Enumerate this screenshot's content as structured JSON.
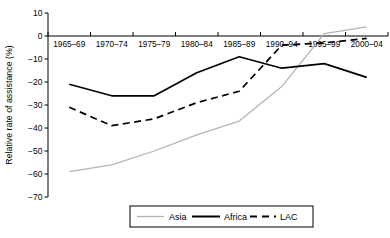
{
  "chart_data": {
    "type": "line",
    "title": "",
    "xlabel": "",
    "ylabel": "Relative rate of assistance (%)",
    "categories": [
      "1965–69",
      "1970–74",
      "1975–79",
      "1980–84",
      "1985–89",
      "1990–94",
      "1995–99",
      "2000–04"
    ],
    "ylim": [
      -70,
      10
    ],
    "yticks": [
      10,
      0,
      -10,
      -20,
      -30,
      -40,
      -50,
      -60,
      -70
    ],
    "ytick_labels": [
      "10",
      "0",
      "−10",
      "−20",
      "−30",
      "−40",
      "−50",
      "−60",
      "−70"
    ],
    "grid": false,
    "legend_position": "bottom",
    "zero_line": true,
    "series": [
      {
        "name": "Asia",
        "style": "solid",
        "color": "#b4b4b4",
        "values": [
          -59,
          -56,
          -50,
          -43,
          -37,
          -22,
          1,
          4
        ]
      },
      {
        "name": "Africa",
        "style": "solid",
        "color": "#000000",
        "values": [
          -21,
          -26,
          -26,
          -16,
          -9,
          -14,
          -12,
          -18
        ]
      },
      {
        "name": "LAC",
        "style": "dashed",
        "color": "#000000",
        "values": [
          -31,
          -39,
          -36,
          -29,
          -24,
          -4,
          -3,
          -1
        ]
      }
    ]
  },
  "legend": {
    "items": [
      {
        "label": "Asia"
      },
      {
        "label": "Africa"
      },
      {
        "label": "LAC"
      }
    ]
  }
}
